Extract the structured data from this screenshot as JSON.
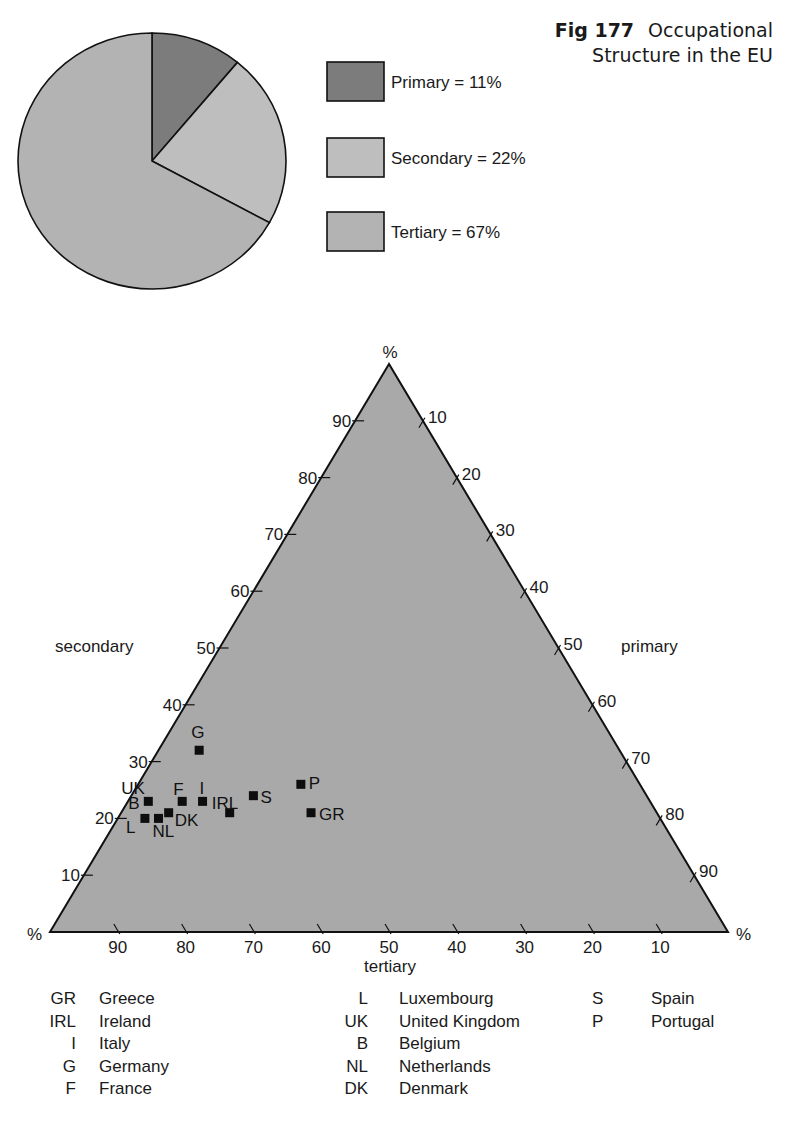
{
  "figure": {
    "number": "Fig 177",
    "title_line1": "Occupational",
    "title_line2": "Structure in the EU"
  },
  "colors": {
    "primary": "#7c7c7c",
    "secondary": "#bebebe",
    "tertiary": "#b3b3b3",
    "triangle_fill": "#a9a9a9",
    "outline": "#111111",
    "marker": "#0d0d0d"
  },
  "pie_legend": [
    {
      "key": "primary",
      "label": "Primary = 11%"
    },
    {
      "key": "secondary",
      "label": "Secondary = 22%"
    },
    {
      "key": "tertiary",
      "label": "Tertiary = 67%"
    }
  ],
  "axis_labels": {
    "left": "secondary",
    "right": "primary",
    "bottom": "tertiary",
    "percent_symbol": "%"
  },
  "country_legend": [
    [
      {
        "abbr": "GR",
        "name": "Greece"
      },
      {
        "abbr": "IRL",
        "name": "Ireland"
      },
      {
        "abbr": "I",
        "name": "Italy"
      },
      {
        "abbr": "G",
        "name": "Germany"
      },
      {
        "abbr": "F",
        "name": "France"
      }
    ],
    [
      {
        "abbr": "L",
        "name": "Luxembourg"
      },
      {
        "abbr": "UK",
        "name": "United Kingdom"
      },
      {
        "abbr": "B",
        "name": "Belgium"
      },
      {
        "abbr": "NL",
        "name": "Netherlands"
      },
      {
        "abbr": "DK",
        "name": "Denmark"
      }
    ],
    [
      {
        "abbr": "S",
        "name": "Spain"
      },
      {
        "abbr": "P",
        "name": "Portugal"
      }
    ]
  ],
  "chart_data": [
    {
      "type": "pie",
      "title": "Occupational Structure in the EU",
      "categories": [
        "Primary",
        "Secondary",
        "Tertiary"
      ],
      "values": [
        11,
        22,
        67
      ],
      "unit": "%",
      "start_angle_deg": 0,
      "direction": "clockwise from 12 o'clock",
      "legend_position": "right"
    },
    {
      "type": "scatter",
      "subtype": "ternary",
      "title": "Occupational Structure in the EU (by country)",
      "axes": {
        "secondary": {
          "label": "secondary",
          "edge": "left",
          "ticks": [
            10,
            20,
            30,
            40,
            50,
            60,
            70,
            80,
            90
          ],
          "range": [
            0,
            100
          ]
        },
        "primary": {
          "label": "primary",
          "edge": "right",
          "ticks": [
            10,
            20,
            30,
            40,
            50,
            60,
            70,
            80,
            90
          ],
          "range": [
            0,
            100
          ]
        },
        "tertiary": {
          "label": "tertiary",
          "edge": "bottom",
          "ticks": [
            90,
            80,
            70,
            60,
            50,
            40,
            30,
            20,
            10
          ],
          "range": [
            0,
            100
          ]
        }
      },
      "grid": false,
      "points": [
        {
          "label": "G",
          "country": "Germany",
          "secondary": 32,
          "primary": 6,
          "tertiary": 62
        },
        {
          "label": "UK",
          "country": "United Kingdom",
          "secondary": 23,
          "primary": 3,
          "tertiary": 74
        },
        {
          "label": "B",
          "country": "Belgium",
          "secondary": 23,
          "primary": 3,
          "tertiary": 74
        },
        {
          "label": "F",
          "country": "France",
          "secondary": 23,
          "primary": 8,
          "tertiary": 69
        },
        {
          "label": "I",
          "country": "Italy",
          "secondary": 23,
          "primary": 11,
          "tertiary": 66
        },
        {
          "label": "DK",
          "country": "Denmark",
          "secondary": 21,
          "primary": 7,
          "tertiary": 72
        },
        {
          "label": "L",
          "country": "Luxembourg",
          "secondary": 20,
          "primary": 4,
          "tertiary": 76
        },
        {
          "label": "NL",
          "country": "Netherlands",
          "secondary": 20,
          "primary": 6,
          "tertiary": 74
        },
        {
          "label": "IRL",
          "country": "Ireland",
          "secondary": 21,
          "primary": 16,
          "tertiary": 63
        },
        {
          "label": "S",
          "country": "Spain",
          "secondary": 24,
          "primary": 18,
          "tertiary": 58
        },
        {
          "label": "P",
          "country": "Portugal",
          "secondary": 26,
          "primary": 24,
          "tertiary": 50
        },
        {
          "label": "GR",
          "country": "Greece",
          "secondary": 21,
          "primary": 28,
          "tertiary": 51
        }
      ],
      "point_label_offsets": {
        "G": [
          -8,
          -12
        ],
        "UK": [
          -27,
          -7
        ],
        "B": [
          -20,
          8
        ],
        "F": [
          -9,
          -6
        ],
        "I": [
          -3,
          -7
        ],
        "DK": [
          6,
          13
        ],
        "L": [
          -19,
          15
        ],
        "NL": [
          -6,
          19
        ],
        "IRL": [
          -18,
          -4
        ],
        "S": [
          7,
          7
        ],
        "P": [
          8,
          5
        ],
        "GR": [
          8,
          7
        ]
      }
    }
  ]
}
